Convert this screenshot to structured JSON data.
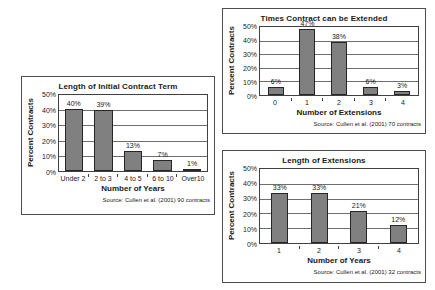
{
  "chart_data": [
    {
      "id": "initial-term",
      "type": "bar",
      "title": "Length of Initial Contract Term",
      "categories": [
        "Under 2",
        "2 to 3",
        "4 to 5",
        "6 to 10",
        "Over10"
      ],
      "values": [
        40,
        39,
        13,
        7,
        1
      ],
      "value_labels": [
        "40%",
        "39%",
        "13%",
        "7%",
        "1%"
      ],
      "xlabel": "Number of Years",
      "ylabel": "Percent Contracts",
      "ylim": [
        0,
        50
      ],
      "yticks": [
        0,
        10,
        20,
        30,
        40,
        50
      ],
      "ytick_labels": [
        "0%",
        "10%",
        "20%",
        "30%",
        "40%",
        "50%"
      ],
      "grid": true,
      "legend": "none",
      "bar_color": "#808080",
      "bar_border_color": "#262626",
      "bar_width_ratio": 0.62,
      "source": "Source: Cullen et al. (2001) 90 contracts"
    },
    {
      "id": "extend-times",
      "type": "bar",
      "title": "Times Contract can be Extended",
      "categories": [
        "0",
        "1",
        "2",
        "3",
        "4"
      ],
      "values": [
        6,
        47,
        38,
        6,
        3
      ],
      "value_labels": [
        "6%",
        "47%",
        "38%",
        "6%",
        "3%"
      ],
      "xlabel": "Number of Extensions",
      "ylabel": "Percent Contracts",
      "ylim": [
        0,
        50
      ],
      "yticks": [
        0,
        10,
        20,
        30,
        40,
        50
      ],
      "ytick_labels": [
        "0%",
        "10%",
        "20%",
        "30%",
        "40%",
        "50%"
      ],
      "grid": true,
      "legend": "none",
      "bar_color": "#808080",
      "bar_border_color": "#262626",
      "bar_width_ratio": 0.5,
      "source": "Source: Cullen et al. (2001) 70 contracts"
    },
    {
      "id": "ext-length",
      "type": "bar",
      "title": "Length of Extensions",
      "categories": [
        "1",
        "2",
        "3",
        "4"
      ],
      "values": [
        33,
        33,
        21,
        12
      ],
      "value_labels": [
        "33%",
        "33%",
        "21%",
        "12%"
      ],
      "xlabel": "Number of Years",
      "ylabel": "Percent Contracts",
      "ylim": [
        0,
        50
      ],
      "yticks": [
        0,
        10,
        20,
        30,
        40,
        50
      ],
      "ytick_labels": [
        "0%",
        "10%",
        "20%",
        "30%",
        "40%",
        "50%"
      ],
      "grid": true,
      "legend": "none",
      "bar_color": "#808080",
      "bar_border_color": "#262626",
      "bar_width_ratio": 0.42,
      "source": "Source: Cullen et al. (2001) 32 contracts"
    }
  ]
}
